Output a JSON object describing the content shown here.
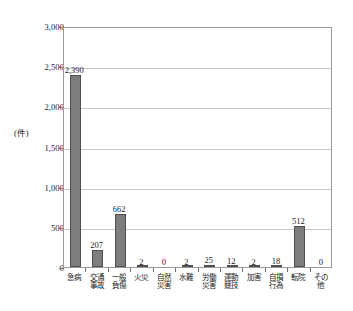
{
  "figure": {
    "caption": ""
  },
  "chart_data": {
    "type": "bar",
    "title": "",
    "xlabel": "",
    "ylabel": "(件)",
    "ylim": [
      0,
      3000
    ],
    "ytick_labels": [
      "0",
      "500",
      "1,000",
      "1,500",
      "2,000",
      "2,500",
      "3,000"
    ],
    "ytick_values": [
      0,
      500,
      1000,
      1500,
      2000,
      2500,
      3000
    ],
    "grid": true,
    "legend": "none",
    "bar_color": "#7d7d7d",
    "bar_edge_color": "#4f4f4f",
    "categories": [
      "急病",
      "交通事故",
      "一般負傷",
      "火災",
      "自然災害",
      "水難",
      "労働災害",
      "運動競技",
      "加害",
      "自損行為",
      "転院",
      "その他"
    ],
    "values": [
      2390,
      207,
      662,
      2,
      0,
      2,
      25,
      12,
      2,
      18,
      512,
      0
    ],
    "value_labels": [
      "2,390",
      "207",
      "662",
      "2",
      "0",
      "2",
      "25",
      "12",
      "2",
      "18",
      "512",
      "0"
    ]
  }
}
